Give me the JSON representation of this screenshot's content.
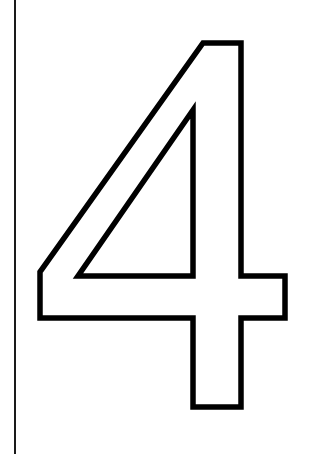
{
  "page": {
    "width": 319,
    "height": 454,
    "background_color": "#ffffff"
  },
  "margin_rule": {
    "name": "left-margin-rule",
    "color": "#1a1a1a",
    "x": 15,
    "y_start": 0,
    "y_end": 454,
    "thickness": 1.6
  },
  "glyph": {
    "character": "4",
    "description": "Large hollow outline numeral four for coloring or tracing",
    "stroke_color": "#000000",
    "fill_color": "#ffffff",
    "stroke_width": 5.5,
    "outer_path": "M 203 43 L 241 43 L 241 276 L 285 276 L 285 318 L 241 318 L 241 407 L 193 407 L 193 318 L 40 318 L 40 272 Z",
    "inner_path": "M 193 110 L 193 276 L 78 276 Z",
    "bounds": {
      "x": 40,
      "y": 43,
      "width": 245,
      "height": 364
    }
  }
}
